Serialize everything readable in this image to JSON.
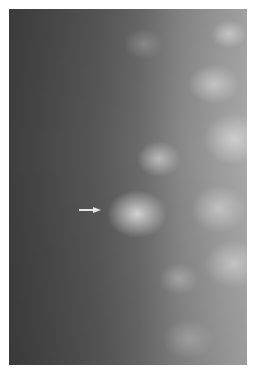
{
  "image": {
    "subject": "mammogram",
    "annotation": {
      "type": "arrow",
      "direction": "right",
      "points_to": "bright focal density",
      "color": "#e0e0e0"
    }
  }
}
